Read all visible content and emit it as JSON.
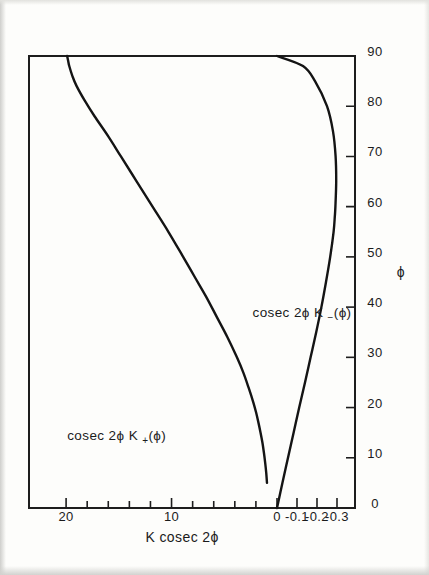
{
  "figure": {
    "orientation_note": "rotated-90",
    "axis_color": "#1d1d1a",
    "curve_color": "#141414"
  },
  "labels": {
    "value_axis_title": "K cosec 2ϕ",
    "phi_axis_title": "ϕ",
    "upper_curve": "cosec 2ϕ K",
    "upper_curve_sub": "+",
    "upper_curve_arg": "(ϕ)",
    "lower_curve": "cosec 2ϕ K",
    "lower_curve_sub": "−",
    "lower_curve_arg": "(ϕ)"
  },
  "chart_data": {
    "type": "line",
    "title": "",
    "xlabel": "ϕ",
    "ylabel": "K cosec 2ϕ",
    "xlim": [
      0,
      90
    ],
    "ylim": [
      -0.35,
      22
    ],
    "xticks": [
      0,
      10,
      20,
      30,
      40,
      50,
      60,
      70,
      80,
      90
    ],
    "xtick_labels": [
      "0",
      "10",
      "20",
      "30",
      "40",
      "50",
      "60",
      "70",
      "80",
      "90"
    ],
    "yticks": [
      20,
      10,
      0,
      -0.1,
      -0.2,
      -0.3
    ],
    "ytick_labels": [
      "20",
      "10",
      "0",
      "-0.1",
      "-0.2",
      "-0.3"
    ],
    "y_upper_section": {
      "note": "linear 0..22 for positive branch",
      "ticks_major": [
        0,
        10,
        20
      ],
      "ticks_minor": [
        2,
        4,
        6,
        8,
        12,
        14,
        16,
        18
      ]
    },
    "y_lower_section": {
      "note": "expanded linear 0..-0.35 for negative branch",
      "ticks_major": [
        0,
        -0.1,
        -0.2,
        -0.3
      ]
    },
    "grid": false,
    "legend": "inline-annotations",
    "series": [
      {
        "name": "cosec 2ϕ K_+(ϕ)",
        "label": "cosec 2ϕ K+(ϕ)",
        "x": [
          5,
          7,
          9,
          11,
          13,
          15,
          17,
          19,
          21,
          24,
          27,
          30,
          34,
          38,
          42,
          46,
          50,
          55,
          60,
          65,
          70,
          74,
          78,
          81,
          84,
          86,
          88,
          89,
          90
        ],
        "y": [
          0.95,
          1.02,
          1.12,
          1.24,
          1.38,
          1.56,
          1.76,
          1.98,
          2.24,
          2.7,
          3.2,
          3.8,
          4.7,
          5.7,
          6.7,
          7.8,
          8.9,
          10.3,
          11.8,
          13.3,
          14.8,
          16.0,
          17.3,
          18.2,
          19.0,
          19.4,
          19.7,
          19.8,
          19.9
        ]
      },
      {
        "name": "cosec 2ϕ K_-(ϕ)",
        "label": "cosec 2ϕ K-(ϕ)",
        "x": [
          0,
          5,
          10,
          15,
          20,
          25,
          30,
          35,
          40,
          45,
          50,
          55,
          58,
          60,
          65,
          70,
          75,
          80,
          85,
          88,
          90
        ],
        "y": [
          0.0,
          -0.027,
          -0.055,
          -0.083,
          -0.111,
          -0.14,
          -0.168,
          -0.196,
          -0.222,
          -0.245,
          -0.266,
          -0.283,
          -0.289,
          -0.292,
          -0.296,
          -0.293,
          -0.28,
          -0.25,
          -0.19,
          -0.13,
          0.0
        ]
      }
    ]
  }
}
